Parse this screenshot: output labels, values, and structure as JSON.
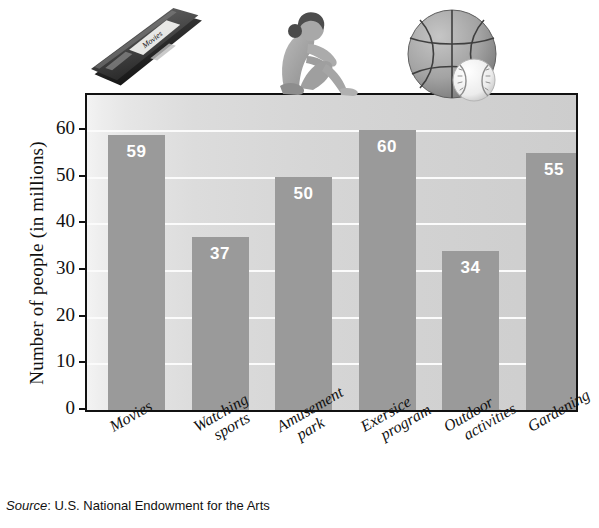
{
  "chart_data": {
    "type": "bar",
    "title": "",
    "xlabel": "",
    "ylabel": "Number of people (in millions)",
    "categories": [
      "Movies",
      "Watching sports",
      "Amusement park",
      "Exersice program",
      "Outdoor activities",
      "Gardening"
    ],
    "category_lines": [
      [
        "Movies"
      ],
      [
        "Watching",
        "sports"
      ],
      [
        "Amusement",
        "park"
      ],
      [
        "Exersice",
        "program"
      ],
      [
        "Outdoor",
        "activities"
      ],
      [
        "Gardening"
      ]
    ],
    "values": [
      59,
      37,
      50,
      60,
      34,
      55
    ],
    "ylim": [
      0,
      67.5
    ],
    "yticks": [
      0,
      10,
      20,
      30,
      40,
      50,
      60
    ],
    "ytick_labels": [
      "0",
      "10",
      "20",
      "30",
      "40",
      "50",
      "60"
    ],
    "grid": true,
    "grid_orientation": "horizontal",
    "legend": "none",
    "bar_color": "#9a9a9a",
    "bar_label_color": "#ffffff",
    "plot_background": "#d8d8d8",
    "frame_color": "#111111"
  },
  "source": {
    "label": "Source",
    "separator": ":",
    "text": " U.S. National Endowment for the Arts"
  },
  "decorations": [
    {
      "name": "vhs-tape",
      "label": "Movies",
      "description": "videotape cassette"
    },
    {
      "name": "person-situp",
      "description": "person doing sit-up exercise"
    },
    {
      "name": "basketball-baseball",
      "description": "basketball with baseball"
    }
  ]
}
